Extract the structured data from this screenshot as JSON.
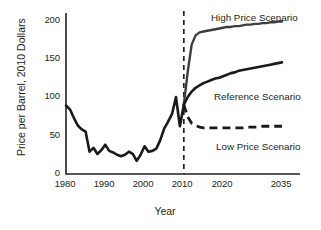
{
  "chart_data": {
    "type": "line",
    "title": "",
    "xlabel": "Year",
    "ylabel": "Price per Barrel, 2010 Dollars",
    "xlim": [
      1978,
      2037
    ],
    "ylim": [
      0,
      210
    ],
    "xticks": [
      1980,
      1990,
      2000,
      2010,
      2020,
      2035
    ],
    "yticks": [
      0,
      50,
      100,
      150,
      200
    ],
    "grid": false,
    "legend_position": "inline-annotations",
    "annotations": [
      {
        "text": "High Price Scenario",
        "x": 2024,
        "y": 205
      },
      {
        "text": "Reference Scenario",
        "x": 2024,
        "y": 108
      },
      {
        "text": "Low Price Scenario",
        "x": 2025,
        "y": 42
      }
    ],
    "vertical_divider": {
      "x": 2010,
      "style": "dashed",
      "label": ""
    },
    "series": [
      {
        "name": "Historical",
        "style": "solid",
        "color": "#1a1a1a",
        "x": [
          1980,
          1981,
          1982,
          1983,
          1984,
          1985,
          1986,
          1987,
          1988,
          1989,
          1990,
          1991,
          1992,
          1993,
          1994,
          1995,
          1996,
          1997,
          1998,
          1999,
          2000,
          2001,
          2002,
          2003,
          2004,
          2005,
          2006,
          2007,
          2008,
          2009,
          2010
        ],
        "y": [
          89,
          84,
          73,
          63,
          58,
          55,
          29,
          34,
          26,
          31,
          38,
          30,
          28,
          25,
          23,
          25,
          29,
          26,
          17,
          25,
          36,
          29,
          30,
          33,
          44,
          59,
          68,
          78,
          100,
          62,
          90
        ]
      },
      {
        "name": "High Price Scenario",
        "style": "solid",
        "color": "#3d3d3d",
        "x": [
          2010,
          2011,
          2012,
          2013,
          2014,
          2015,
          2016,
          2017,
          2018,
          2019,
          2020,
          2021,
          2022,
          2023,
          2024,
          2025,
          2026,
          2027,
          2028,
          2029,
          2030,
          2031,
          2032,
          2033,
          2034,
          2035
        ],
        "y": [
          90,
          133,
          168,
          180,
          184,
          185,
          186,
          187,
          188,
          189,
          190,
          191,
          191,
          192,
          192,
          193,
          194,
          194,
          195,
          195,
          196,
          196,
          197,
          197,
          198,
          198
        ]
      },
      {
        "name": "Reference Scenario",
        "style": "solid",
        "color": "#1a1a1a",
        "x": [
          2010,
          2011,
          2012,
          2013,
          2014,
          2015,
          2016,
          2017,
          2018,
          2019,
          2020,
          2021,
          2022,
          2023,
          2024,
          2025,
          2026,
          2027,
          2028,
          2029,
          2030,
          2031,
          2032,
          2033,
          2034,
          2035
        ],
        "y": [
          90,
          100,
          107,
          112,
          115,
          118,
          120,
          122,
          124,
          125,
          127,
          129,
          131,
          132,
          134,
          135,
          136,
          137,
          138,
          139,
          140,
          141,
          142,
          143,
          144,
          145
        ]
      },
      {
        "name": "Low Price Scenario",
        "style": "dashed",
        "color": "#1a1a1a",
        "x": [
          2010,
          2011,
          2012,
          2013,
          2014,
          2015,
          2016,
          2017,
          2018,
          2019,
          2020,
          2021,
          2022,
          2023,
          2024,
          2025,
          2026,
          2027,
          2028,
          2029,
          2030,
          2031,
          2032,
          2033,
          2034,
          2035
        ],
        "y": [
          90,
          74,
          66,
          63,
          61,
          60,
          60,
          60,
          60,
          60,
          60,
          60,
          60,
          60,
          60,
          60,
          61,
          61,
          61,
          61,
          62,
          62,
          62,
          62,
          62,
          62
        ]
      }
    ]
  },
  "axes": {
    "y_title": "Price per Barrel, 2010 Dollars",
    "x_title": "Year",
    "y_ticks": [
      "0",
      "50",
      "100",
      "150",
      "200"
    ],
    "x_ticks": [
      "1980",
      "1990",
      "2000",
      "2010",
      "2020",
      "2035"
    ]
  },
  "labels": {
    "high": "High Price Scenario",
    "reference": "Reference Scenario",
    "low": "Low Price Scenario"
  },
  "colors": {
    "axis": "#231f20",
    "historical": "#1a1a1a",
    "high": "#3d3d3d",
    "reference": "#1a1a1a",
    "low": "#1a1a1a",
    "background": "#ffffff"
  }
}
